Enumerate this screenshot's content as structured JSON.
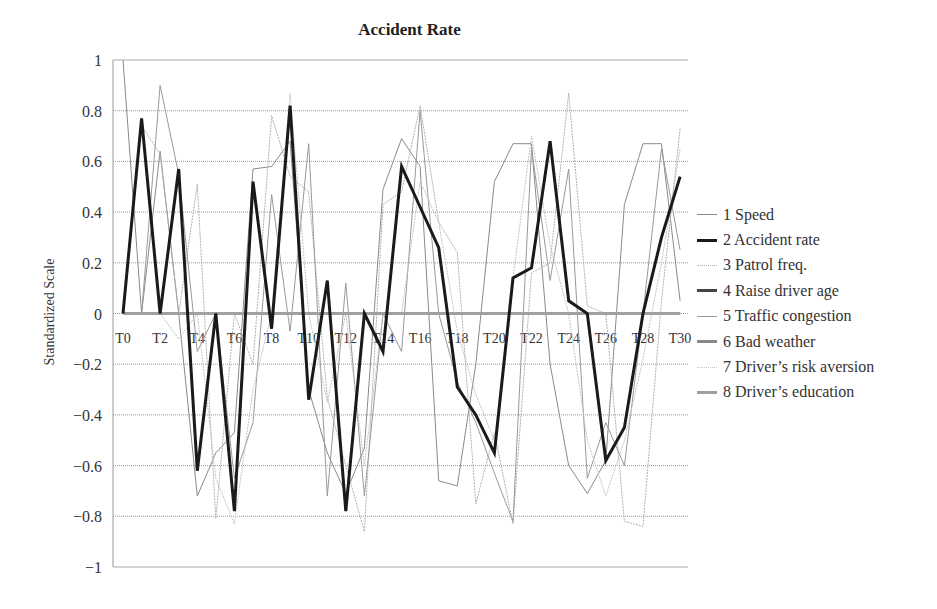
{
  "chart_data": {
    "type": "line",
    "title": "Accident Rate",
    "xlabel": "",
    "ylabel": "Standardized Scale",
    "ylim": [
      -1,
      1
    ],
    "yticks": [
      1,
      0.8,
      0.6,
      0.4,
      0.2,
      0,
      -0.2,
      -0.4,
      -0.6,
      -0.8,
      -1
    ],
    "ytick_labels": [
      "1",
      "0.8",
      "0.6",
      "0.4",
      "0.2",
      "0",
      "−0.2",
      "−0.4",
      "−0.6",
      "−0.8",
      "−1"
    ],
    "x": [
      "T0",
      "T1",
      "T2",
      "T3",
      "T4",
      "T5",
      "T6",
      "T7",
      "T8",
      "T9",
      "T10",
      "T11",
      "T12",
      "T13",
      "T14",
      "T15",
      "T16",
      "T17",
      "T18",
      "T19",
      "T20",
      "T21",
      "T22",
      "T23",
      "T24",
      "T25",
      "T26",
      "T27",
      "T28",
      "T29",
      "T30"
    ],
    "xtick_labels": [
      "T0",
      "T2",
      "T4",
      "T6",
      "T8",
      "T10",
      "T12",
      "T14",
      "T16",
      "T18",
      "T20",
      "T22",
      "T24",
      "T26",
      "T28",
      "T30"
    ],
    "grid": true,
    "legend_position": "right",
    "series": [
      {
        "name": "1 Speed",
        "color": "#8a8a8a",
        "width": 1,
        "dash": "",
        "values": [
          1.0,
          0.0,
          0.64,
          0.0,
          -0.72,
          -0.55,
          -0.47,
          0.57,
          0.58,
          0.68,
          -0.3,
          -0.55,
          -0.71,
          -0.53,
          0.49,
          0.69,
          0.58,
          -0.66,
          -0.68,
          -0.2,
          0.52,
          0.67,
          0.67,
          -0.2,
          -0.6,
          -0.71,
          -0.58,
          0.43,
          0.67,
          0.67,
          0.05
        ]
      },
      {
        "name": "2 Accident rate",
        "color": "#1a1a1a",
        "width": 3,
        "dash": "",
        "values": [
          0.0,
          0.77,
          0.0,
          0.57,
          -0.62,
          0.0,
          -0.78,
          0.52,
          -0.06,
          0.82,
          -0.34,
          0.13,
          -0.78,
          0.0,
          -0.15,
          0.58,
          0.42,
          0.26,
          -0.29,
          -0.4,
          -0.55,
          0.14,
          0.18,
          0.68,
          0.05,
          0.0,
          -0.58,
          -0.45,
          0.0,
          0.3,
          0.54
        ]
      },
      {
        "name": "3 Patrol freq.",
        "color": "#b0b0b0",
        "width": 1,
        "dash": "2,1",
        "values": [
          0.0,
          0.74,
          0.63,
          0.0,
          0.51,
          -0.81,
          0.0,
          -0.2,
          0.78,
          0.54,
          0.48,
          -0.33,
          -0.6,
          -0.86,
          0.43,
          0.48,
          0.82,
          0.36,
          0.24,
          -0.75,
          -0.47,
          -0.83,
          0.16,
          0.2,
          0.87,
          0.03,
          0.0,
          -0.82,
          -0.84,
          0.05,
          0.73
        ]
      },
      {
        "name": "4 Raise driver age",
        "color": "#444444",
        "width": 3,
        "dash": "",
        "values": [
          0,
          0,
          0,
          0,
          0,
          0,
          0,
          0,
          0,
          0,
          0,
          0,
          0,
          0,
          0,
          0,
          0,
          0,
          0,
          0,
          0,
          0,
          0,
          0,
          0,
          0,
          0,
          0,
          0,
          0,
          0
        ]
      },
      {
        "name": "5 Traffic congestion",
        "color": "#999999",
        "width": 1,
        "dash": "",
        "values": [
          0.0,
          0.0,
          0.9,
          0.55,
          -0.15,
          0.0,
          -0.65,
          -0.43,
          0.47,
          -0.07,
          0.67,
          -0.72,
          0.12,
          -0.72,
          0.0,
          -0.15,
          0.8,
          0.0,
          -0.27,
          -0.43,
          -0.63,
          -0.82,
          0.65,
          0.13,
          0.57,
          -0.65,
          -0.43,
          -0.6,
          0.0,
          0.65,
          0.25
        ]
      },
      {
        "name": "6 Bad weather",
        "color": "#888888",
        "width": 3,
        "dash": "",
        "values": [
          0,
          0,
          0,
          0,
          0,
          0,
          0,
          0,
          0,
          0,
          0,
          0,
          0,
          0,
          0,
          0,
          0,
          0,
          0,
          0,
          0,
          0,
          0,
          0,
          0,
          0,
          0,
          0,
          0,
          0,
          0
        ]
      },
      {
        "name": "7 Driver's risk aversion",
        "color": "#c4c4c4",
        "width": 1,
        "dash": "2,1",
        "values": [
          0.0,
          0.0,
          0.0,
          -0.1,
          0.0,
          -0.65,
          -0.83,
          -0.3,
          0.0,
          0.87,
          0.0,
          -0.35,
          0.0,
          -0.6,
          0.0,
          0.0,
          0.52,
          0.36,
          -0.07,
          -0.32,
          -0.5,
          0.14,
          0.7,
          0.27,
          0.0,
          -0.5,
          -0.72,
          -0.5,
          -0.18,
          0.2,
          0.65
        ]
      },
      {
        "name": "8 Driver's education",
        "color": "#a0a0a0",
        "width": 3,
        "dash": "",
        "values": [
          0,
          0,
          0,
          0,
          0,
          0,
          0,
          0,
          0,
          0,
          0,
          0,
          0,
          0,
          0,
          0,
          0,
          0,
          0,
          0,
          0,
          0,
          0,
          0,
          0,
          0,
          0,
          0,
          0,
          0,
          0
        ]
      }
    ]
  }
}
